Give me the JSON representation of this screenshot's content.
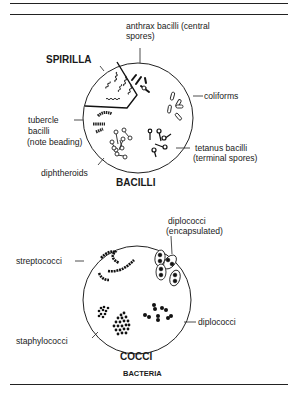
{
  "diagram": {
    "caption": "BACTERIA",
    "bacilli_panel": {
      "title": "BACILLI",
      "section_title": "SPIRILLA",
      "labels": {
        "anthrax_line1": "anthrax bacilli (central",
        "anthrax_line2": "spores)",
        "coliforms": "coliforms",
        "tetanus_line1": "tetanus bacilli",
        "tetanus_line2": "(terminal spores)",
        "tubercle_line1": "tubercle",
        "tubercle_line2": "bacilli",
        "tubercle_line3": "(note beading)",
        "diphtheroids": "diphtheroids"
      }
    },
    "cocci_panel": {
      "title": "COCCI",
      "labels": {
        "diplococci_encap_line1": "diplococci",
        "diplococci_encap_line2": "(encapsulated)",
        "streptococci": "streptococci",
        "diplococci": "diplococci",
        "staphylococci": "staphylococci"
      }
    }
  }
}
